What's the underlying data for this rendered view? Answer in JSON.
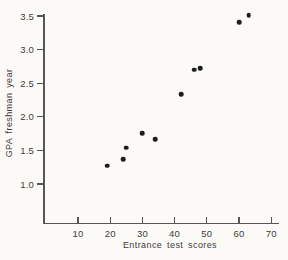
{
  "chart_data": {
    "type": "scatter",
    "title": "",
    "xlabel": "Entrance test scores",
    "ylabel": "GPA freshman year",
    "points": [
      [
        19,
        1.27
      ],
      [
        24,
        1.37
      ],
      [
        25,
        1.54
      ],
      [
        30,
        1.76
      ],
      [
        34,
        1.67
      ],
      [
        42,
        2.34
      ],
      [
        46,
        2.7
      ],
      [
        48,
        2.72
      ],
      [
        60,
        3.41
      ],
      [
        63,
        3.51
      ]
    ],
    "x_ticks": [
      10,
      20,
      30,
      40,
      50,
      60,
      70
    ],
    "x_tick_labels": [
      "10",
      "20",
      "30",
      "40",
      "50",
      "60",
      "70"
    ],
    "y_ticks": [
      1.0,
      1.5,
      2.0,
      2.5,
      3.0,
      3.5
    ],
    "y_tick_labels": [
      "1.0",
      "1.5",
      "2.0",
      "2.5",
      "3.0",
      "3.5"
    ],
    "xlim": [
      -1,
      72.5
    ],
    "ylim": [
      0.42,
      3.58
    ],
    "grid": false,
    "legend": null,
    "marker": "filled-circle",
    "colors": {
      "paper": "#fbfaf7",
      "ink": "#1d1d1d",
      "axis": "#565656",
      "label": "#3b3b3b"
    }
  }
}
